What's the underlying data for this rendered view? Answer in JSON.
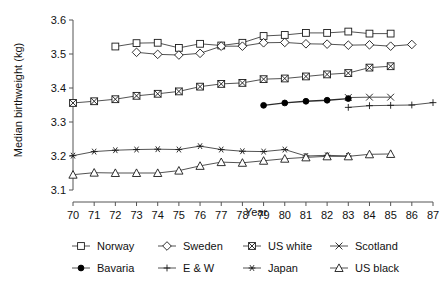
{
  "chart_data": {
    "type": "line",
    "title": "",
    "xlabel": "Year",
    "ylabel": "Median birthweight (kg)",
    "xlim": [
      70,
      87
    ],
    "ylim": [
      3.1,
      3.6
    ],
    "xticks": [
      70,
      71,
      72,
      73,
      74,
      75,
      76,
      77,
      78,
      79,
      80,
      81,
      82,
      83,
      84,
      85,
      86,
      87
    ],
    "xtick_labels": [
      "70",
      "71",
      "72",
      "73",
      "74",
      "75",
      "76",
      "77",
      "78",
      "79",
      "80",
      "81",
      "82",
      "83",
      "84",
      "85",
      "86",
      "87"
    ],
    "yticks": [
      3.1,
      3.2,
      3.3,
      3.4,
      3.5,
      3.6
    ],
    "ytick_labels": [
      "3.1",
      "3.2",
      "3.3",
      "3.4",
      "3.5",
      "3.6"
    ],
    "grid": false,
    "legend_position": "bottom",
    "series": [
      {
        "name": "Norway",
        "marker": "square",
        "x": [
          72,
          73,
          74,
          75,
          76,
          77,
          78,
          79,
          80,
          81,
          82,
          83,
          84,
          85
        ],
        "values": [
          3.522,
          3.532,
          3.533,
          3.518,
          3.53,
          3.525,
          3.533,
          3.553,
          3.556,
          3.562,
          3.562,
          3.566,
          3.56,
          3.56
        ]
      },
      {
        "name": "Sweden",
        "marker": "diamond",
        "x": [
          73,
          74,
          75,
          76,
          77,
          78,
          79,
          80,
          81,
          82,
          83,
          84,
          85,
          86
        ],
        "values": [
          3.505,
          3.499,
          3.497,
          3.502,
          3.523,
          3.523,
          3.533,
          3.534,
          3.53,
          3.529,
          3.526,
          3.527,
          3.523,
          3.528
        ]
      },
      {
        "name": "US white",
        "marker": "crossed-square",
        "x": [
          70,
          71,
          72,
          73,
          74,
          75,
          76,
          77,
          78,
          79,
          80,
          81,
          82,
          83,
          84,
          85
        ],
        "values": [
          3.356,
          3.361,
          3.367,
          3.377,
          3.383,
          3.39,
          3.404,
          3.412,
          3.415,
          3.426,
          3.428,
          3.434,
          3.44,
          3.444,
          3.46,
          3.464
        ]
      },
      {
        "name": "Scotland",
        "marker": "x",
        "x": [
          83,
          84,
          85
        ],
        "values": [
          3.372,
          3.373,
          3.373
        ]
      },
      {
        "name": "Bavaria",
        "marker": "filled-circle",
        "x": [
          79,
          80,
          81,
          82,
          83
        ],
        "values": [
          3.349,
          3.356,
          3.361,
          3.364,
          3.369
        ]
      },
      {
        "name": "E & W",
        "marker": "plus",
        "x": [
          83,
          84,
          85,
          86,
          87
        ],
        "values": [
          3.343,
          3.348,
          3.349,
          3.35,
          3.357
        ]
      },
      {
        "name": "Japan",
        "marker": "asterisk",
        "x": [
          70,
          71,
          72,
          73,
          74,
          75,
          76,
          77,
          78,
          79,
          80,
          81,
          82,
          83
        ],
        "values": [
          3.201,
          3.213,
          3.217,
          3.219,
          3.22,
          3.219,
          3.229,
          3.219,
          3.214,
          3.213,
          3.219,
          3.2,
          3.202,
          3.2
        ]
      },
      {
        "name": "US black",
        "marker": "triangle",
        "x": [
          70,
          71,
          72,
          73,
          74,
          75,
          76,
          77,
          78,
          79,
          80,
          81,
          82,
          83,
          84,
          85
        ],
        "values": [
          3.145,
          3.151,
          3.15,
          3.15,
          3.15,
          3.157,
          3.171,
          3.182,
          3.18,
          3.186,
          3.192,
          3.196,
          3.199,
          3.199,
          3.205,
          3.206
        ]
      }
    ]
  },
  "legend": {
    "rows": [
      [
        {
          "label": "Norway",
          "marker": "square"
        },
        {
          "label": "Sweden",
          "marker": "diamond"
        },
        {
          "label": "US white",
          "marker": "crossed-square"
        },
        {
          "label": "Scotland",
          "marker": "x"
        }
      ],
      [
        {
          "label": "Bavaria",
          "marker": "filled-circle"
        },
        {
          "label": "E & W",
          "marker": "plus"
        },
        {
          "label": "Japan",
          "marker": "asterisk"
        },
        {
          "label": "US black",
          "marker": "triangle"
        }
      ]
    ]
  },
  "colors": {
    "line": "#404040",
    "marker_stroke": "#1a1a1a",
    "marker_fill": "#ffffff",
    "axis": "#555555",
    "text": "#111111",
    "background": "#ffffff"
  }
}
